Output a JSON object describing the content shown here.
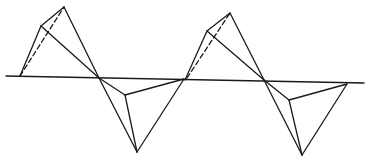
{
  "diagram": {
    "stroke_color": "#1a1a1a",
    "background": "#ffffff",
    "baseline": {
      "x1": 6,
      "y1": 76,
      "x2": 364,
      "y2": 83
    },
    "figures": [
      {
        "upper": {
          "foot": [
            20,
            76
          ],
          "left": [
            41,
            26
          ],
          "apex": [
            64,
            7
          ],
          "cross": [
            99,
            78
          ]
        },
        "lower": {
          "cross": [
            99,
            78
          ],
          "inner": [
            125,
            95
          ],
          "bottom": [
            137,
            152
          ],
          "right": [
            184,
            79
          ]
        }
      },
      {
        "upper": {
          "foot": [
            185,
            80
          ],
          "left": [
            207,
            31
          ],
          "apex": [
            230,
            13
          ],
          "cross": [
            264,
            80
          ]
        },
        "lower": {
          "cross": [
            264,
            80
          ],
          "inner": [
            289,
            100
          ],
          "bottom": [
            302,
            155
          ],
          "right": [
            347,
            84
          ]
        }
      }
    ]
  }
}
